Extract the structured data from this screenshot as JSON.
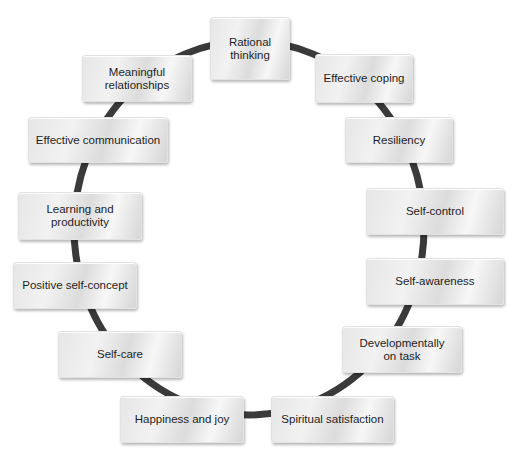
{
  "diagram": {
    "type": "cycle",
    "ring": {
      "color": "#3a3a3a",
      "center": [
        249,
        228
      ],
      "rx": 175,
      "ry": 187,
      "stroke_width": 7
    },
    "node_style": {
      "background": "#e8e8e8",
      "text_color": "#1e1e1e"
    },
    "nodes": [
      {
        "id": "rational-thinking",
        "label": "Rational\nthinking",
        "box": [
          210,
          17,
          80,
          63
        ]
      },
      {
        "id": "effective-coping",
        "label": "Effective coping",
        "box": [
          315,
          54,
          98,
          49
        ]
      },
      {
        "id": "resiliency",
        "label": "Resiliency",
        "box": [
          345,
          117,
          108,
          46
        ]
      },
      {
        "id": "self-control",
        "label": "Self-control",
        "box": [
          366,
          188,
          138,
          47
        ]
      },
      {
        "id": "self-awareness",
        "label": "Self-awareness",
        "box": [
          366,
          258,
          138,
          47
        ]
      },
      {
        "id": "developmentally-on-task",
        "label": "Developmentally\non task",
        "box": [
          342,
          326,
          120,
          47
        ]
      },
      {
        "id": "spiritual-satisfaction",
        "label": "Spiritual satisfaction",
        "box": [
          271,
          396,
          123,
          47
        ]
      },
      {
        "id": "happiness-and-joy",
        "label": "Happiness and joy",
        "box": [
          120,
          396,
          124,
          47
        ]
      },
      {
        "id": "self-care",
        "label": "Self-care",
        "box": [
          58,
          331,
          124,
          47
        ]
      },
      {
        "id": "positive-self-concept",
        "label": "Positive self-concept",
        "box": [
          13,
          262,
          124,
          47
        ]
      },
      {
        "id": "learning-and-productivity",
        "label": "Learning and\nproductivity",
        "box": [
          18,
          192,
          124,
          48
        ]
      },
      {
        "id": "effective-communication",
        "label": "Effective communication",
        "box": [
          28,
          117,
          140,
          46
        ]
      },
      {
        "id": "meaningful-relationships",
        "label": "Meaningful\nrelationships",
        "box": [
          82,
          55,
          110,
          47
        ]
      }
    ]
  }
}
